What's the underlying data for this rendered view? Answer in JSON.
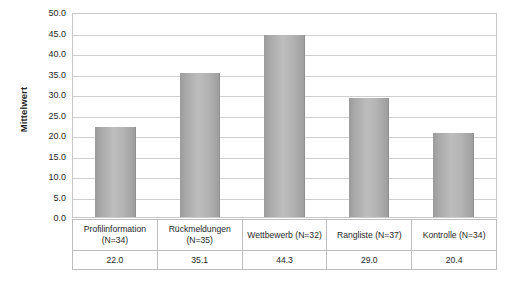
{
  "chart_data": {
    "type": "bar",
    "title": "",
    "subtitle": "",
    "xlabel": "",
    "ylabel": "Mittelwert",
    "ylim": [
      0,
      50
    ],
    "ytick_step": 5,
    "grid": true,
    "legend": "none",
    "orientation": "vertical",
    "categories": [
      "Profilinformation (N=34)",
      "Rückmeldungen (N=35)",
      "Wettbewerb (N=32)",
      "Rangliste (N=37)",
      "Kontrolle (N=34)"
    ],
    "values": [
      22.0,
      35.1,
      44.3,
      29.0,
      20.4
    ],
    "value_labels": [
      "22.0",
      "35.1",
      "44.3",
      "29.0",
      "20.4"
    ],
    "ytick_labels": [
      "0.0",
      "5.0",
      "10.0",
      "15.0",
      "20.0",
      "25.0",
      "30.0",
      "35.0",
      "40.0",
      "45.0",
      "50.0"
    ],
    "ytick_values": [
      0,
      5,
      10,
      15,
      20,
      25,
      30,
      35,
      40,
      45,
      50
    ],
    "colors": {
      "bar_light": "#bdbdbd",
      "bar_dark": "#9b9b9b",
      "gridline": "#cfcfcf",
      "plot_border": "#c8c8c8",
      "table_border": "#bdbdbd",
      "text": "#1f1f1f",
      "background": "#ffffff"
    }
  },
  "table": {
    "category_cells": [
      "Profilinformation (N=34)",
      "Rückmeldungen (N=35)",
      "Wettbewerb (N=32)",
      "Rangliste (N=37)",
      "Kontrolle (N=34)"
    ],
    "value_cells": [
      "22.0",
      "35.1",
      "44.3",
      "29.0",
      "20.4"
    ]
  }
}
